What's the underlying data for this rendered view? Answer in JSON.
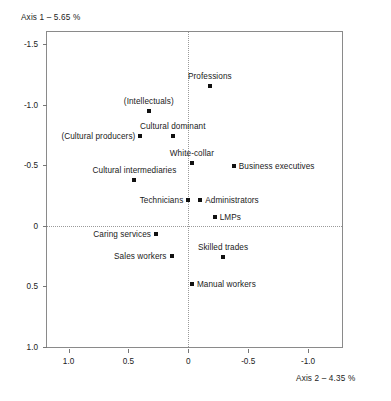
{
  "chart_data": {
    "type": "scatter",
    "title": "",
    "xlabel": "Axis 2 – 4.35 %",
    "ylabel": "Axis 1 – 5.65 %",
    "xlim": [
      1.18,
      -1.3
    ],
    "ylim": [
      -1.6,
      1.02
    ],
    "x_axis_reversed": true,
    "y_axis_reversed": true,
    "grid": false,
    "reference_lines": {
      "x": 0,
      "y": 0,
      "style": "dotted"
    },
    "legend": "none",
    "xticks": [
      "1.0",
      "0.5",
      "0",
      "-0.5",
      "-1.0"
    ],
    "xtick_values": [
      1.0,
      0.5,
      0,
      -0.5,
      -1.0
    ],
    "yticks": [
      "-1.5",
      "-1.0",
      "-0.5",
      "0",
      "0.5",
      "1.0"
    ],
    "ytick_values": [
      -1.5,
      -1.0,
      -0.5,
      0,
      0.5,
      1.0
    ],
    "points": [
      {
        "label": "Professions",
        "x": -0.18,
        "y": -1.15,
        "label_pos": "above"
      },
      {
        "label": "(Intellectuals)",
        "x": 0.33,
        "y": -0.95,
        "label_pos": "above"
      },
      {
        "label": "Cultural dominant",
        "x": 0.13,
        "y": -0.74,
        "label_pos": "above"
      },
      {
        "label": "(Cultural producers)",
        "x": 0.4,
        "y": -0.74,
        "label_pos": "left"
      },
      {
        "label": "White-collar",
        "x": -0.03,
        "y": -0.52,
        "label_pos": "above"
      },
      {
        "label": "Business executives",
        "x": -0.38,
        "y": -0.49,
        "label_pos": "right"
      },
      {
        "label": "Cultural intermediaries",
        "x": 0.45,
        "y": -0.38,
        "label_pos": "above"
      },
      {
        "label": "Technicians",
        "x": 0.0,
        "y": -0.21,
        "label_pos": "left"
      },
      {
        "label": "Administrators",
        "x": -0.1,
        "y": -0.21,
        "label_pos": "right"
      },
      {
        "label": "LMPs",
        "x": -0.22,
        "y": -0.07,
        "label_pos": "right"
      },
      {
        "label": "Caring services",
        "x": 0.27,
        "y": 0.07,
        "label_pos": "left"
      },
      {
        "label": "Sales workers",
        "x": 0.14,
        "y": 0.25,
        "label_pos": "left"
      },
      {
        "label": "Skilled trades",
        "x": -0.29,
        "y": 0.26,
        "label_pos": "above"
      },
      {
        "label": "Manual workers",
        "x": -0.03,
        "y": 0.48,
        "label_pos": "right"
      }
    ]
  },
  "colors": {
    "marker": "#111111",
    "frame": "#8a8a8a",
    "reference_line": "#9a9a9a",
    "text": "#1a1a1a",
    "background": "#ffffff"
  }
}
